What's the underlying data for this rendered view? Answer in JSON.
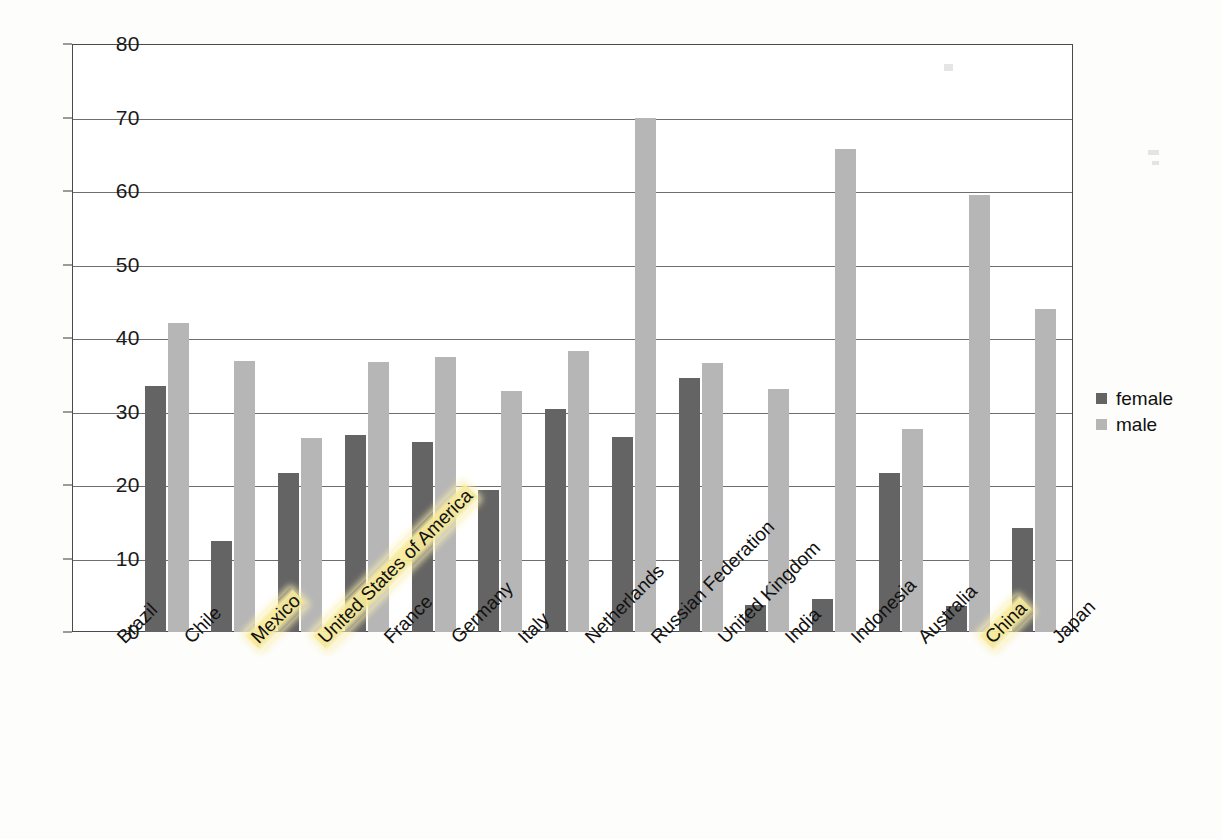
{
  "chart_data": {
    "type": "bar",
    "title": "",
    "xlabel": "",
    "ylabel": "",
    "ylim": [
      0,
      80
    ],
    "yticks": [
      0,
      10,
      20,
      30,
      40,
      50,
      60,
      70,
      80
    ],
    "grid": true,
    "legend_position": "right",
    "categories": [
      "Brazil",
      "Chile",
      "Mexico",
      "United States of America",
      "France",
      "Germany",
      "Italy",
      "Netherlands",
      "Russian Federation",
      "United Kingdom",
      "India",
      "Indonesia",
      "Australia",
      "China",
      "Japan"
    ],
    "highlighted_categories": [
      "Mexico",
      "United States of America",
      "China"
    ],
    "series": [
      {
        "name": "female",
        "color": "#646464",
        "values": [
          0,
          33.5,
          12.4,
          21.6,
          26.8,
          25.8,
          19.3,
          30.3,
          26.5,
          34.6,
          3.7,
          4.5,
          21.7,
          3.5,
          14.1
        ]
      },
      {
        "name": "male",
        "color": "#b6b6b6",
        "values": [
          0,
          42.1,
          36.9,
          26.4,
          36.7,
          37.4,
          32.8,
          38.3,
          70.0,
          36.6,
          33.0,
          65.7,
          27.6,
          59.4,
          44.0
        ]
      }
    ]
  },
  "legend": {
    "items": [
      {
        "label": "female",
        "swatch": "female-swatch"
      },
      {
        "label": "male",
        "swatch": "male-swatch"
      }
    ]
  },
  "caption": {
    "text": ""
  },
  "colors": {
    "female": "#646464",
    "male": "#b6b6b6",
    "highlight": "#f5e796",
    "axis": "#4a4a4a",
    "grid": "#6e6e6e"
  }
}
